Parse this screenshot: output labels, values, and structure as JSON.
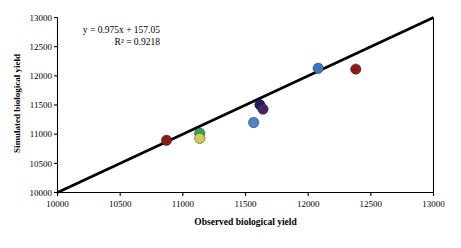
{
  "chart_data": {
    "type": "scatter",
    "title": "",
    "xlabel": "Observed biological yield",
    "ylabel": "Simulated biological yield",
    "xlim": [
      10000,
      13000
    ],
    "ylim": [
      10000,
      13000
    ],
    "xticks": [
      10000,
      10500,
      11000,
      11500,
      12000,
      12500,
      13000
    ],
    "yticks": [
      10000,
      10500,
      11000,
      11500,
      12000,
      12500,
      13000
    ],
    "xticklabels": [
      "10000",
      "10500",
      "11000",
      "11500",
      "12000",
      "12500",
      "13000"
    ],
    "yticklabels": [
      "10000",
      "10500",
      "11000",
      "11500",
      "12000",
      "12500",
      "13000"
    ],
    "grid": false,
    "legend": false,
    "annotations": [
      {
        "name": "regression-equation",
        "text": "y = 0.975x + 157.05"
      },
      {
        "name": "r-squared",
        "text": "R² = 0.9218"
      }
    ],
    "fit_line": {
      "name": "one-to-one-line",
      "slope": 1,
      "intercept": 0,
      "color": "#000000",
      "width": 2.6,
      "from": [
        10000,
        10000
      ],
      "to": [
        13000,
        13000
      ]
    },
    "points": [
      {
        "x": 10870,
        "y": 10895,
        "color": "#8c1a16",
        "label": "dark-red-low"
      },
      {
        "x": 11135,
        "y": 11015,
        "color": "#3aa657",
        "label": "green"
      },
      {
        "x": 11135,
        "y": 10930,
        "color": "#c9cf52",
        "label": "yellow-green"
      },
      {
        "x": 11565,
        "y": 11200,
        "color": "#4a86c8",
        "label": "light-blue-mid"
      },
      {
        "x": 11615,
        "y": 11505,
        "color": "#1b1b5e",
        "label": "navy"
      },
      {
        "x": 11640,
        "y": 11430,
        "color": "#4a1f63",
        "label": "purple"
      },
      {
        "x": 12080,
        "y": 12130,
        "color": "#3f74c0",
        "label": "blue-high"
      },
      {
        "x": 12380,
        "y": 12115,
        "color": "#8c1a16",
        "label": "dark-red-high"
      }
    ],
    "marker_radius": 5.2,
    "axis_color": "#000000",
    "background": "#ffffff"
  }
}
